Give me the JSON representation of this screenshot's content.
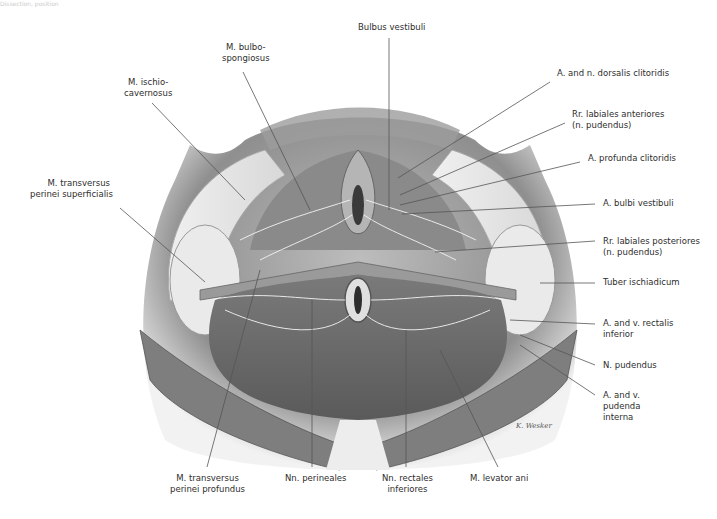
{
  "caption_fragment": "Dissection, position",
  "figure": {
    "signature": "K. Wesker",
    "colors": {
      "background": "#ffffff",
      "label_text": "#2e2e2e",
      "leader_line": "#555555",
      "skin_shadow": "#8a8a8a",
      "muscle_dark": "#6b6b6b",
      "fat_light": "#e6e6e6"
    }
  },
  "labels": {
    "m_bulbospongiosus": [
      "M. bulbo-",
      "spongiosus"
    ],
    "bulbus_vestibuli": "Bulbus vestibuli",
    "m_ischiocavernosus": [
      "M. ischio-",
      "cavernosus"
    ],
    "a_n_dorsalis_clitoridis": "A. and n. dorsalis clitoridis",
    "rr_labiales_anteriores": [
      "Rr. labiales anteriores",
      "(n. pudendus)"
    ],
    "a_profunda_clitoridis": "A. profunda clitoridis",
    "m_transversus_perinei_superficialis": [
      "M. transversus",
      "perinei superficialis"
    ],
    "a_bulbi_vestibuli": "A. bulbi vestibuli",
    "rr_labiales_posteriores": [
      "Rr. labiales posteriores",
      "(n. pudendus)"
    ],
    "tuber_ischiadicum": "Tuber ischiadicum",
    "a_v_rectalis_inferior": [
      "A. and v. rectalis",
      "inferior"
    ],
    "n_pudendus": "N. pudendus",
    "a_v_pudenda_interna": [
      "A. and v.",
      "pudenda",
      "interna"
    ],
    "m_transversus_perinei_profundus": [
      "M. transversus",
      "perinei profundus"
    ],
    "nn_perineales": "Nn. perineales",
    "nn_rectales_inferiores": [
      "Nn. rectales",
      "inferiores"
    ],
    "m_levator_ani": "M. levator ani"
  }
}
